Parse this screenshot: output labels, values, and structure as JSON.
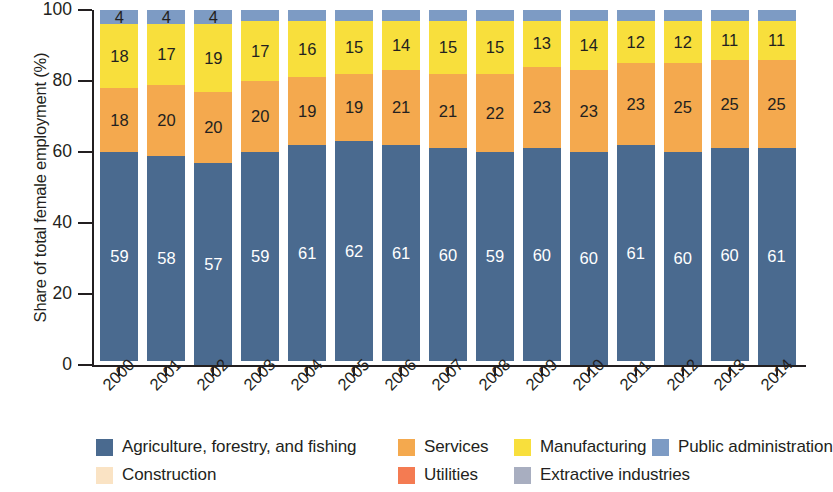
{
  "chart_data": {
    "type": "bar",
    "subtype": "stacked-bar-100",
    "title": "",
    "xlabel": "",
    "ylabel": "Share of total female employment (%)",
    "ylim": [
      0,
      100
    ],
    "yticks": [
      0,
      20,
      40,
      60,
      80,
      100
    ],
    "grid": false,
    "legend_position": "bottom",
    "categories": [
      "2000",
      "2001",
      "2002",
      "2003",
      "2004",
      "2005",
      "2006",
      "2007",
      "2008",
      "2009",
      "2010",
      "2011",
      "2012",
      "2013",
      "2014"
    ],
    "series": [
      {
        "name": "Agriculture, forestry, and fishing",
        "color": "#4a6a8f",
        "label_color": "#ffffff",
        "values": [
          59,
          58,
          57,
          59,
          61,
          62,
          61,
          60,
          59,
          60,
          60,
          61,
          60,
          60,
          61
        ]
      },
      {
        "name": "Utilities",
        "color": "#f47b52",
        "label_color": "#231f20",
        "values": [
          0,
          0,
          0,
          0,
          0,
          0,
          0,
          0,
          0,
          0,
          0,
          0,
          0,
          0,
          0
        ]
      },
      {
        "name": "Construction",
        "color": "#fae3c4",
        "label_color": "#231f20",
        "values": [
          0,
          0,
          0,
          0,
          0,
          0,
          0,
          0,
          0,
          0,
          0,
          0,
          0,
          0,
          0
        ]
      },
      {
        "name": "Services",
        "color": "#f4a94e",
        "label_color": "#231f20",
        "values": [
          18,
          20,
          20,
          20,
          19,
          19,
          21,
          21,
          22,
          23,
          23,
          23,
          25,
          25,
          25
        ]
      },
      {
        "name": "Manufacturing",
        "color": "#f8df3c",
        "label_color": "#231f20",
        "values": [
          18,
          17,
          19,
          17,
          16,
          15,
          14,
          15,
          15,
          13,
          14,
          12,
          12,
          11,
          11
        ]
      },
      {
        "name": "Extractive industries",
        "color": "#a8aec0",
        "label_color": "#231f20",
        "values": [
          0,
          0,
          0,
          0,
          0,
          0,
          0,
          0,
          0,
          0,
          0,
          0,
          0,
          0,
          0
        ]
      },
      {
        "name": "Public administration",
        "color": "#7d9bc4",
        "label_color": "#231f20",
        "values": [
          4,
          4,
          4,
          3,
          3,
          3,
          3,
          3,
          3,
          3,
          3,
          3,
          3,
          3,
          3
        ]
      }
    ],
    "stack_order": [
      "Agriculture, forestry, and fishing",
      "Utilities",
      "Construction",
      "Services",
      "Manufacturing",
      "Extractive industries",
      "Public administration"
    ],
    "legend": [
      {
        "label": "Agriculture, forestry, and fishing",
        "color": "#4a6a8f"
      },
      {
        "label": "Services",
        "color": "#f4a94e"
      },
      {
        "label": "Manufacturing",
        "color": "#f8df3c"
      },
      {
        "label": "Public administration",
        "color": "#7d9bc4"
      },
      {
        "label": "Construction",
        "color": "#fae3c4"
      },
      {
        "label": "Utilities",
        "color": "#f47b52"
      },
      {
        "label": "Extractive industries",
        "color": "#a8aec0"
      }
    ]
  }
}
